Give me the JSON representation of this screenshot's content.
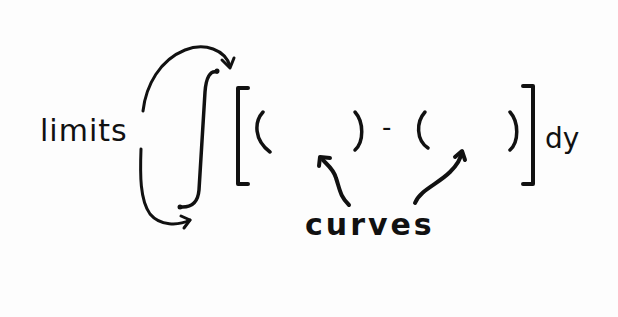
{
  "diagram": {
    "labels": {
      "limits": "limits",
      "curves": "curves",
      "differential": "dy",
      "minus": "-"
    },
    "expression": {
      "integral": "∫",
      "left_bracket": "[",
      "right_bracket": "]",
      "open_paren": "(",
      "close_paren": ")"
    },
    "colors": {
      "ink": "#111111",
      "paper": "#fdfdfd"
    }
  }
}
